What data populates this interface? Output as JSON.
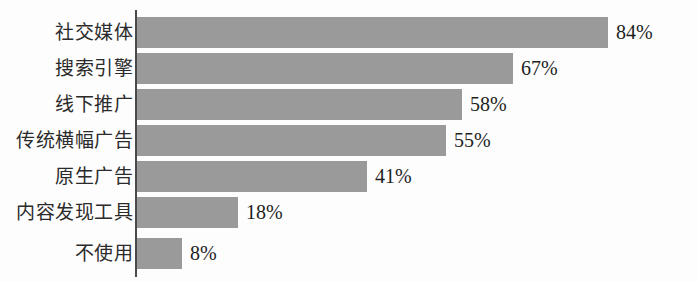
{
  "chart_data": {
    "type": "bar",
    "orientation": "horizontal",
    "title": "",
    "subtitle": "",
    "xlabel": "",
    "ylabel": "",
    "xlim": [
      0,
      100
    ],
    "grid": false,
    "legend": null,
    "value_suffix": "%",
    "categories": [
      "社交媒体",
      "搜索引擎",
      "线下推广",
      "传统横幅广告",
      "原生广告",
      "内容发现工具",
      "不使用"
    ],
    "values": [
      84,
      67,
      58,
      55,
      41,
      18,
      8
    ],
    "value_labels": [
      "84%",
      "67%",
      "58%",
      "55%",
      "41%",
      "18%",
      "8%"
    ],
    "colors": {
      "bar": "#9a9a9a",
      "axis": "#4a4a4a",
      "background": "#fdfdfd",
      "label_text": "#2b2b2b",
      "value_text": "#1f1f1f"
    }
  }
}
